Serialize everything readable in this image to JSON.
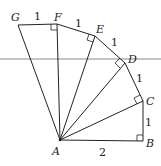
{
  "diagram": {
    "type": "spiral of right triangles",
    "points": {
      "A": {
        "label": "A",
        "x": 60,
        "y": 140
      },
      "B": {
        "label": "B",
        "x": 143,
        "y": 141
      },
      "C": {
        "label": "C",
        "x": 143,
        "y": 101
      },
      "D": {
        "label": "D",
        "x": 125,
        "y": 63
      },
      "E": {
        "label": "E",
        "x": 95,
        "y": 36
      },
      "F": {
        "label": "F",
        "x": 57,
        "y": 24
      },
      "G": {
        "label": "G",
        "x": 18,
        "y": 25
      }
    },
    "segment_labels": {
      "AB": "2",
      "BC": "1",
      "CD": "1",
      "DE": "1",
      "EF": "1",
      "FG": "1"
    },
    "right_angles": [
      "B",
      "C",
      "D",
      "E",
      "F"
    ]
  }
}
